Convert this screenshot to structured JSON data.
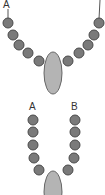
{
  "diagram": {
    "top_necklace": {
      "labels": {
        "left": "A"
      },
      "bead_count": 10,
      "pendant": "oval",
      "colors": {
        "bead": "#7a7a7a",
        "pendant": "#b4b4b4",
        "string": "#555555"
      }
    },
    "bottom_necklace": {
      "labels": {
        "left": "A",
        "right": "B"
      },
      "bead_count": 10,
      "pendant": "oval",
      "colors": {
        "bead": "#7a7a7a",
        "pendant": "#b4b4b4",
        "string": "#555555"
      }
    }
  }
}
